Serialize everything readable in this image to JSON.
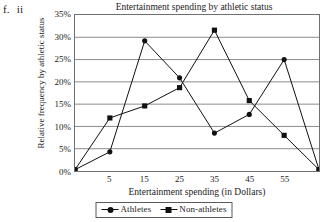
{
  "outline": {
    "item_letter": "f.",
    "sub_item": "ii"
  },
  "chart_data": {
    "type": "line",
    "title": "Entertainment spending by athletic status",
    "xlabel": "Entertainment spending (in Dollars)",
    "ylabel": "Relative frequency by athletic status",
    "x": [
      -5,
      5,
      15,
      25,
      35,
      45,
      55,
      65
    ],
    "x_tick_labels": [
      "5",
      "15",
      "25",
      "35",
      "45",
      "55"
    ],
    "x_tick_values": [
      5,
      15,
      25,
      35,
      45,
      55
    ],
    "xlim": [
      -5,
      65
    ],
    "ylim": [
      0,
      35
    ],
    "y_tick_labels": [
      "0%",
      "5%",
      "10%",
      "15%",
      "20%",
      "25%",
      "30%",
      "35%"
    ],
    "y_tick_values": [
      0,
      5,
      10,
      15,
      20,
      25,
      30,
      35
    ],
    "grid": "horizontal",
    "legend_position": "bottom",
    "series": [
      {
        "name": "Athletes",
        "marker": "circle",
        "color": "#111111",
        "values": [
          0.3,
          4.3,
          29.2,
          20.9,
          8.5,
          12.7,
          25.0,
          0.3
        ]
      },
      {
        "name": "Non-athletes",
        "marker": "square",
        "color": "#111111",
        "values": [
          0.3,
          11.9,
          14.6,
          18.7,
          31.6,
          15.8,
          8.0,
          0.3
        ]
      }
    ]
  },
  "legend": {
    "entries": [
      {
        "label": "Athletes",
        "marker": "circle-marker-icon"
      },
      {
        "label": "Non-athletes",
        "marker": "square-marker-icon"
      }
    ]
  },
  "colors": {
    "axis": "#6f6f6f",
    "grid": "#8c8c8c",
    "line": "#111111",
    "text": "#1a1a1a",
    "background": "#ffffff"
  }
}
